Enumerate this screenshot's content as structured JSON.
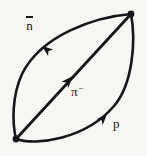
{
  "figure": {
    "kind": "particle-interaction-diagram",
    "background_color": "#f7f6f3",
    "ink_color": "#17161a",
    "canvas": {
      "width": 147,
      "height": 156
    }
  },
  "vertices": [
    {
      "id": "vertex-top-right",
      "x": 131,
      "y": 14,
      "radius": 3.4
    },
    {
      "id": "vertex-bottom-left",
      "x": 16,
      "y": 139,
      "radius": 3.4
    }
  ],
  "lines": [
    {
      "id": "arc-upper-left",
      "particle_label": "n̄",
      "particle_name": "antineutron",
      "shape": "arc",
      "from": "vertex-top-right",
      "to": "vertex-bottom-left",
      "direction": "down-left",
      "path": "M 131 14 C 96 17 42 34 22 74 C 12 96 12 122 16 139",
      "stroke_width": 2.6,
      "arrow": {
        "x": 42,
        "y": 46,
        "angle_deg": 218
      }
    },
    {
      "id": "chord-diagonal",
      "particle_label": "π⁻",
      "particle_name": "pi minus",
      "shape": "straight",
      "from": "vertex-bottom-left",
      "to": "vertex-top-right",
      "direction": "up-right",
      "path": "M 16 139 L 131 14",
      "stroke_width": 2.8,
      "arrow": {
        "x": 73,
        "y": 76,
        "angle_deg": 313
      }
    },
    {
      "id": "arc-lower-right",
      "particle_label": "p",
      "particle_name": "proton",
      "shape": "arc",
      "from": "vertex-bottom-left",
      "to": "vertex-top-right",
      "direction": "up-right",
      "path": "M 16 139 C 36 146 86 139 114 106 C 133 84 136 40 131 14",
      "stroke_width": 2.6,
      "arrow": {
        "x": 107,
        "y": 114,
        "angle_deg": 312
      }
    }
  ],
  "labels": [
    {
      "id": "label-antineutron",
      "base": "n",
      "overbar": true,
      "superscript": "",
      "text": "n̄",
      "x": 26,
      "y": 16
    },
    {
      "id": "label-pion",
      "base": "π",
      "overbar": false,
      "superscript": "−",
      "text": "π⁻",
      "x": 71,
      "y": 84
    },
    {
      "id": "label-proton",
      "base": "p",
      "overbar": false,
      "superscript": "",
      "text": "p",
      "x": 113,
      "y": 117
    }
  ]
}
